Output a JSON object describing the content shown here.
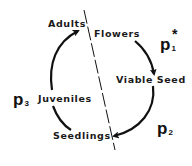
{
  "diagram": {
    "type": "life-cycle",
    "stages": [
      {
        "id": "adults",
        "label": "Adults"
      },
      {
        "id": "flowers",
        "label": "Flowers"
      },
      {
        "id": "viable_seed",
        "label": "Viable Seed"
      },
      {
        "id": "seedlings",
        "label": "Seedlings"
      },
      {
        "id": "juveniles",
        "label": "Juveniles"
      }
    ],
    "transitions": [
      {
        "from": "flowers",
        "to": "viable_seed",
        "param": "p1",
        "arrow": true
      },
      {
        "from": "viable_seed",
        "to": "seedlings",
        "param": "p2",
        "arrow": true
      },
      {
        "from": "seedlings",
        "to": "juveniles",
        "param": "p3",
        "arrow": false
      },
      {
        "from": "juveniles",
        "to": "adults",
        "param": "p3",
        "arrow": true
      }
    ],
    "parameters": {
      "p1": {
        "base": "p",
        "subscript": "1",
        "superscript": "*"
      },
      "p2": {
        "base": "p",
        "subscript": "2"
      },
      "p3": {
        "base": "p",
        "subscript": "3"
      }
    },
    "divider": {
      "style": "dashed",
      "description": "diagonal dashed line separating Adults/Juveniles/Seedlings side from Flowers/Viable Seed side"
    },
    "colors": {
      "ink": "#111111",
      "background": "#ffffff"
    }
  }
}
